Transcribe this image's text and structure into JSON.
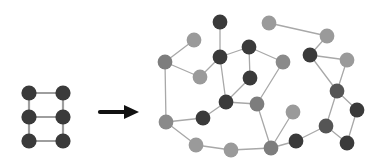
{
  "figure": {
    "background_color": "#ffffff",
    "width": 380,
    "height": 168
  },
  "palette": {
    "node_dark": "#3a3a3a",
    "node_medium": "#6e6e6e",
    "node_light": "#9a9a9a",
    "edge_dark": "#6b6b6b",
    "edge_light": "#b3b3b3",
    "arrow_color": "#111111"
  },
  "arrow": {
    "label": "transforms-into",
    "glyph": "→",
    "shaft": {
      "x1": 100,
      "y1": 112,
      "x2": 125,
      "y2": 112
    },
    "head": {
      "points": "124,105 139,112 124,119"
    },
    "stroke_width": 4.2
  },
  "left_graph": {
    "name": "grid-ladder-graph",
    "node_count": 6,
    "edge_count": 7,
    "node_radius": 7.6,
    "edge_width": 2.2,
    "edge_color": "#9e9e9e",
    "nodes": [
      {
        "id": "L0",
        "x": 29,
        "y": 93,
        "shade": "#3a3a3a"
      },
      {
        "id": "L1",
        "x": 63,
        "y": 93,
        "shade": "#3a3a3a"
      },
      {
        "id": "L2",
        "x": 29,
        "y": 117,
        "shade": "#3a3a3a"
      },
      {
        "id": "L3",
        "x": 63,
        "y": 117,
        "shade": "#3a3a3a"
      },
      {
        "id": "L4",
        "x": 29,
        "y": 141,
        "shade": "#3a3a3a"
      },
      {
        "id": "L5",
        "x": 63,
        "y": 141,
        "shade": "#3a3a3a"
      }
    ],
    "edges": [
      [
        "L0",
        "L1"
      ],
      [
        "L0",
        "L2"
      ],
      [
        "L1",
        "L3"
      ],
      [
        "L2",
        "L3"
      ],
      [
        "L2",
        "L4"
      ],
      [
        "L3",
        "L5"
      ],
      [
        "L4",
        "L5"
      ]
    ]
  },
  "right_graph": {
    "name": "random-network-graph",
    "node_count": 25,
    "edge_count": 30,
    "node_radius": 7.4,
    "edge_width": 1.3,
    "edge_color": "#a8a8a8",
    "nodes": [
      {
        "id": "R0",
        "x": 220,
        "y": 22,
        "shade": "#3a3a3a"
      },
      {
        "id": "R1",
        "x": 194,
        "y": 40,
        "shade": "#9a9a9a"
      },
      {
        "id": "R2",
        "x": 249,
        "y": 47,
        "shade": "#3a3a3a"
      },
      {
        "id": "R3",
        "x": 269,
        "y": 23,
        "shade": "#9a9a9a"
      },
      {
        "id": "R4",
        "x": 327,
        "y": 36,
        "shade": "#9a9a9a"
      },
      {
        "id": "R5",
        "x": 165,
        "y": 62,
        "shade": "#7d7d7d"
      },
      {
        "id": "R6",
        "x": 220,
        "y": 57,
        "shade": "#3a3a3a"
      },
      {
        "id": "R7",
        "x": 310,
        "y": 55,
        "shade": "#3a3a3a"
      },
      {
        "id": "R8",
        "x": 347,
        "y": 60,
        "shade": "#9a9a9a"
      },
      {
        "id": "R9",
        "x": 200,
        "y": 77,
        "shade": "#9a9a9a"
      },
      {
        "id": "R10",
        "x": 250,
        "y": 78,
        "shade": "#3a3a3a"
      },
      {
        "id": "R11",
        "x": 283,
        "y": 62,
        "shade": "#8a8a8a"
      },
      {
        "id": "R12",
        "x": 337,
        "y": 91,
        "shade": "#555555"
      },
      {
        "id": "R13",
        "x": 166,
        "y": 122,
        "shade": "#8a8a8a"
      },
      {
        "id": "R14",
        "x": 226,
        "y": 102,
        "shade": "#3a3a3a"
      },
      {
        "id": "R15",
        "x": 257,
        "y": 104,
        "shade": "#7d7d7d"
      },
      {
        "id": "R16",
        "x": 293,
        "y": 112,
        "shade": "#9a9a9a"
      },
      {
        "id": "R17",
        "x": 357,
        "y": 110,
        "shade": "#3a3a3a"
      },
      {
        "id": "R18",
        "x": 203,
        "y": 118,
        "shade": "#3a3a3a"
      },
      {
        "id": "R19",
        "x": 326,
        "y": 126,
        "shade": "#555555"
      },
      {
        "id": "R20",
        "x": 196,
        "y": 145,
        "shade": "#9a9a9a"
      },
      {
        "id": "R21",
        "x": 231,
        "y": 150,
        "shade": "#9a9a9a"
      },
      {
        "id": "R22",
        "x": 271,
        "y": 148,
        "shade": "#7d7d7d"
      },
      {
        "id": "R23",
        "x": 296,
        "y": 141,
        "shade": "#3a3a3a"
      },
      {
        "id": "R24",
        "x": 347,
        "y": 143,
        "shade": "#3a3a3a"
      }
    ],
    "edges": [
      [
        "R0",
        "R6"
      ],
      [
        "R1",
        "R5"
      ],
      [
        "R2",
        "R6"
      ],
      [
        "R2",
        "R10"
      ],
      [
        "R2",
        "R11"
      ],
      [
        "R3",
        "R4"
      ],
      [
        "R4",
        "R7"
      ],
      [
        "R5",
        "R9"
      ],
      [
        "R5",
        "R13"
      ],
      [
        "R6",
        "R9"
      ],
      [
        "R6",
        "R14"
      ],
      [
        "R7",
        "R8"
      ],
      [
        "R7",
        "R12"
      ],
      [
        "R8",
        "R12"
      ],
      [
        "R10",
        "R14"
      ],
      [
        "R11",
        "R15"
      ],
      [
        "R12",
        "R17"
      ],
      [
        "R12",
        "R19"
      ],
      [
        "R13",
        "R18"
      ],
      [
        "R13",
        "R20"
      ],
      [
        "R14",
        "R15"
      ],
      [
        "R14",
        "R18"
      ],
      [
        "R15",
        "R22"
      ],
      [
        "R16",
        "R22"
      ],
      [
        "R17",
        "R24"
      ],
      [
        "R19",
        "R23"
      ],
      [
        "R19",
        "R24"
      ],
      [
        "R20",
        "R21"
      ],
      [
        "R21",
        "R22"
      ],
      [
        "R22",
        "R23"
      ]
    ]
  }
}
